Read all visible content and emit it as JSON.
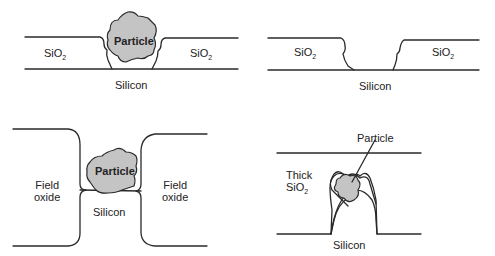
{
  "panels": {
    "top_left": {
      "oxide_left": "SiO",
      "oxide_right": "SiO",
      "oxide_sub": "2",
      "particle": "Particle",
      "substrate": "Silicon"
    },
    "top_right": {
      "oxide_left": "SiO",
      "oxide_right": "SiO",
      "oxide_sub": "2",
      "substrate": "Silicon"
    },
    "bottom_left": {
      "field_left_1": "Field",
      "field_left_2": "oxide",
      "field_right_1": "Field",
      "field_right_2": "oxide",
      "particle": "Particle",
      "substrate": "Silicon"
    },
    "bottom_right": {
      "oxide_1": "Thick",
      "oxide_2": "SiO",
      "oxide_sub": "2",
      "particle_callout": "Particle",
      "substrate": "Silicon"
    }
  },
  "colors": {
    "line": "#2a2a2a",
    "particle_fill": "#c4c4c4",
    "background": "#ffffff"
  }
}
